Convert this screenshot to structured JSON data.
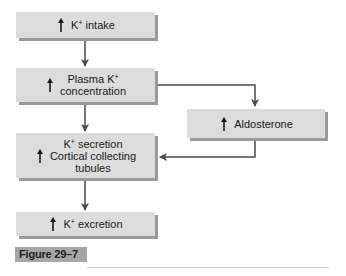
{
  "diagram": {
    "nodes": [
      {
        "id": "intake",
        "prefix": "K",
        "sup": "+",
        "text": " intake",
        "indicator": "increase"
      },
      {
        "id": "plasma",
        "line1_prefix": "Plasma K",
        "line1_sup": "+",
        "line2": "concentration",
        "indicator": "increase"
      },
      {
        "id": "aldosterone",
        "text": "Aldosterone",
        "indicator": "increase"
      },
      {
        "id": "secretion",
        "line1_prefix": "K",
        "line1_sup": "+",
        "line1_rest": " secretion",
        "line2": "Cortical collecting",
        "line3": "tubules",
        "indicator": "increase"
      },
      {
        "id": "excretion",
        "prefix": "K",
        "sup": "+",
        "text": " excretion",
        "indicator": "increase"
      }
    ],
    "edges": [
      {
        "from": "intake",
        "to": "plasma"
      },
      {
        "from": "plasma",
        "to": "secretion"
      },
      {
        "from": "plasma",
        "to": "aldosterone"
      },
      {
        "from": "aldosterone",
        "to": "secretion"
      },
      {
        "from": "secretion",
        "to": "excretion"
      }
    ],
    "colors": {
      "box": "#dcdcdc",
      "shadow": "#9a9a9a",
      "line": "#4a4a4a",
      "figure_label_bg": "#a6a6a6"
    }
  },
  "figure": {
    "label": "Figure 29–7"
  }
}
